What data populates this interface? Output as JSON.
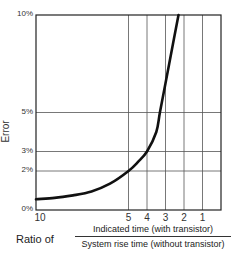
{
  "chart_data": {
    "type": "line",
    "title": "",
    "ylabel": "Error",
    "xlabel_prefix": "Ratio of",
    "xlabel_numerator": "Indicated time (with transistor)",
    "xlabel_denominator": "System rise time (without transistor)",
    "x_ticks": [
      "10",
      "5",
      "4",
      "3",
      "2",
      "1"
    ],
    "y_ticks": [
      "0%",
      "2%",
      "3%",
      "5%",
      "10%"
    ],
    "xlim": [
      10,
      0
    ],
    "ylim": [
      0,
      10
    ],
    "x_axis_reversed": true,
    "grid": {
      "vertical_at": [
        5,
        4,
        3,
        2,
        1
      ],
      "horizontal_at": [
        2,
        3,
        5
      ]
    },
    "series": [
      {
        "name": "Error vs ratio",
        "x": [
          10,
          9,
          8,
          7,
          6,
          5,
          4.5,
          4,
          3.5,
          3.3,
          3,
          2.6,
          2.3
        ],
        "y": [
          0.55,
          0.62,
          0.75,
          0.95,
          1.35,
          2.0,
          2.45,
          3.0,
          4.0,
          5.0,
          6.5,
          8.5,
          10.0
        ]
      }
    ],
    "legend": null
  },
  "colors": {
    "curve": "#111111",
    "grid": "#555555",
    "frame": "#222222"
  }
}
